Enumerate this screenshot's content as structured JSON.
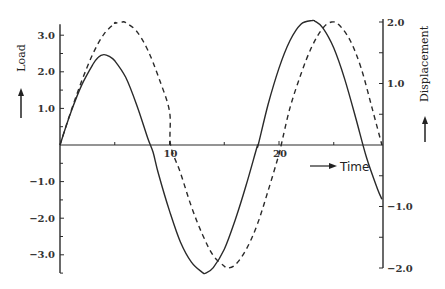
{
  "chart_data": {
    "type": "line",
    "title": "",
    "xlabel": "Time",
    "ylabel": "Load",
    "y2label": "Displacement",
    "x_ticks": [
      {
        "value": 10,
        "label": "10"
      },
      {
        "value": 20,
        "label": "20"
      }
    ],
    "x_minor_ticks": [
      5,
      15,
      25
    ],
    "xlim": [
      0,
      29.4
    ],
    "y_ticks": [
      {
        "value": 3.0,
        "label": "3.0"
      },
      {
        "value": 2.0,
        "label": "2.0"
      },
      {
        "value": 1.0,
        "label": "1.0"
      },
      {
        "value": -1.0,
        "label": "-1.0"
      },
      {
        "value": -2.0,
        "label": "-2.0"
      },
      {
        "value": -3.0,
        "label": "-3.0"
      }
    ],
    "ylim": [
      -3.5,
      3.3
    ],
    "y2_ticks": [
      {
        "value": 2.0,
        "label": "2.0"
      },
      {
        "value": 1.0,
        "label": "1.0"
      },
      {
        "value": -1.0,
        "label": "-1.0"
      },
      {
        "value": -2.0,
        "label": "-2.0"
      }
    ],
    "y2lim": [
      -2.0,
      2.05
    ],
    "grid": false,
    "legend": null,
    "series": [
      {
        "name": "Load",
        "axis": "left",
        "style": "solid",
        "points": [
          [
            0,
            0
          ],
          [
            1,
            0.9
          ],
          [
            2,
            1.65
          ],
          [
            3,
            2.2
          ],
          [
            3.5,
            2.4
          ],
          [
            4,
            2.47
          ],
          [
            4.5,
            2.42
          ],
          [
            5,
            2.3
          ],
          [
            6,
            1.85
          ],
          [
            7,
            1.1
          ],
          [
            8,
            0.2
          ],
          [
            8.5,
            -0.2
          ],
          [
            9,
            -0.8
          ],
          [
            10,
            -1.8
          ],
          [
            11,
            -2.65
          ],
          [
            12,
            -3.2
          ],
          [
            13,
            -3.48
          ],
          [
            13.3,
            -3.5
          ],
          [
            14,
            -3.35
          ],
          [
            15,
            -2.85
          ],
          [
            16,
            -2.05
          ],
          [
            17,
            -1.1
          ],
          [
            18,
            -0.05
          ],
          [
            18.1,
            0
          ],
          [
            19,
            1.1
          ],
          [
            20,
            2.1
          ],
          [
            21,
            2.85
          ],
          [
            22,
            3.3
          ],
          [
            23,
            3.4
          ],
          [
            23.3,
            3.38
          ],
          [
            24,
            3.2
          ],
          [
            25,
            2.65
          ],
          [
            26,
            1.8
          ],
          [
            27,
            0.75
          ],
          [
            28,
            -0.35
          ],
          [
            29,
            -1.2
          ],
          [
            29.4,
            -1.48
          ]
        ]
      },
      {
        "name": "Displacement",
        "axis": "right",
        "style": "dashed",
        "points": [
          [
            0,
            0
          ],
          [
            1,
            0.55
          ],
          [
            2,
            1.05
          ],
          [
            3,
            1.48
          ],
          [
            4,
            1.8
          ],
          [
            5,
            1.98
          ],
          [
            5,
            1.98
          ],
          [
            5.7,
            2.0
          ],
          [
            6,
            1.99
          ],
          [
            7,
            1.85
          ],
          [
            8,
            1.55
          ],
          [
            9,
            1.1
          ],
          [
            10,
            0.55
          ],
          [
            10.1,
            0
          ],
          [
            11,
            -0.45
          ],
          [
            12,
            -1.0
          ],
          [
            13,
            -1.45
          ],
          [
            14,
            -1.8
          ],
          [
            15,
            -1.97
          ],
          [
            15.3,
            -2.0
          ],
          [
            16,
            -1.95
          ],
          [
            17,
            -1.7
          ],
          [
            18,
            -1.3
          ],
          [
            19,
            -0.75
          ],
          [
            20,
            -0.15
          ],
          [
            20.2,
            0
          ],
          [
            21,
            0.6
          ],
          [
            22,
            1.15
          ],
          [
            23,
            1.6
          ],
          [
            24,
            1.9
          ],
          [
            24.8,
            2.0
          ],
          [
            25.5,
            1.95
          ],
          [
            26.5,
            1.7
          ],
          [
            27.5,
            1.25
          ],
          [
            28.5,
            0.6
          ],
          [
            29.4,
            0
          ]
        ]
      }
    ],
    "annotations": [
      {
        "text": "↑",
        "near": "Load label",
        "meaning": "increasing load direction arrow"
      },
      {
        "text": "→ Time",
        "near": "x-axis right",
        "meaning": "time direction arrow"
      },
      {
        "text": "↑",
        "near": "Displacement label",
        "meaning": "increasing displacement direction arrow"
      }
    ]
  },
  "labels": {
    "load": "Load",
    "displacement": "Displacement",
    "time": "Time"
  }
}
